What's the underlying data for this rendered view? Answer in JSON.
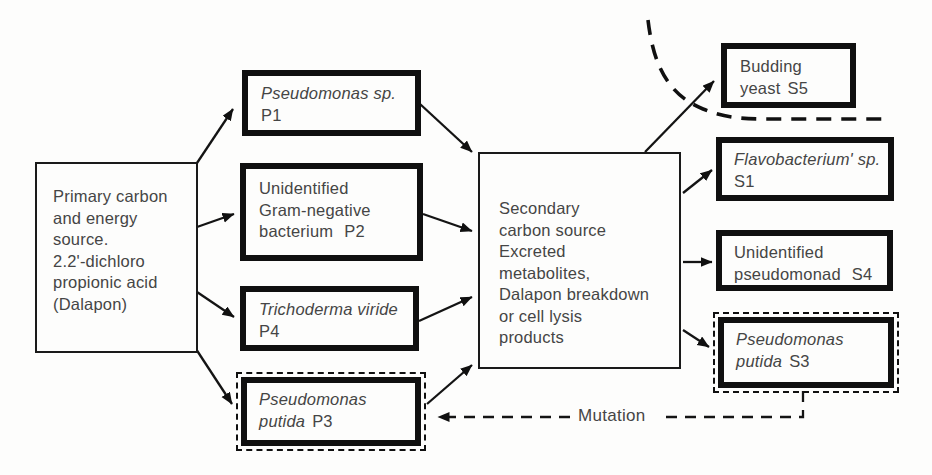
{
  "figure": {
    "kind": "microbial community flow diagram",
    "colors": {
      "background": "#fdfdfc",
      "line": "#101010",
      "text": "#454545"
    }
  },
  "nodes": {
    "primary": {
      "lines": [
        "Primary carbon",
        "and energy",
        "source.",
        "2.2'-dichloro",
        "propionic acid",
        "(Dalapon)"
      ]
    },
    "p1": {
      "species": "Pseudomonas sp.",
      "strain": "P1"
    },
    "p2": {
      "line1": "Unidentified",
      "line2": "Gram-negative",
      "line3": "bacterium",
      "strain": "P2"
    },
    "p4": {
      "species": "Trichoderma viride",
      "strain": "P4"
    },
    "p3": {
      "species_line1": "Pseudomonas",
      "species_line2": "putida",
      "strain": "P3"
    },
    "secondary": {
      "lines": [
        "Secondary",
        "carbon source",
        "Excreted",
        "metabolites,",
        "Dalapon breakdown",
        "or cell lysis",
        "products"
      ]
    },
    "s5": {
      "line1": "Budding",
      "line2": "yeast",
      "strain": "S5"
    },
    "s1": {
      "species": "Flavobacterium' sp.",
      "strain": "S1"
    },
    "s4": {
      "line1": "Unidentified",
      "line2": "pseudomonad",
      "strain": "S4"
    },
    "s3": {
      "species_line1": "Pseudomonas",
      "species_line2": "putida",
      "strain": "S3"
    }
  },
  "labels": {
    "mutation": "Mutation"
  },
  "edges": [
    {
      "from": "primary",
      "to": "p1",
      "style": "solid"
    },
    {
      "from": "primary",
      "to": "p2",
      "style": "solid"
    },
    {
      "from": "primary",
      "to": "p4",
      "style": "solid"
    },
    {
      "from": "primary",
      "to": "p3",
      "style": "solid"
    },
    {
      "from": "p1",
      "to": "secondary",
      "style": "solid"
    },
    {
      "from": "p2",
      "to": "secondary",
      "style": "solid"
    },
    {
      "from": "p4",
      "to": "secondary",
      "style": "solid"
    },
    {
      "from": "p3",
      "to": "secondary",
      "style": "solid"
    },
    {
      "from": "secondary",
      "to": "s5",
      "style": "solid"
    },
    {
      "from": "secondary",
      "to": "s1",
      "style": "solid"
    },
    {
      "from": "secondary",
      "to": "s4",
      "style": "solid"
    },
    {
      "from": "secondary",
      "to": "s3",
      "style": "solid"
    },
    {
      "from": "s3",
      "to": "p3",
      "style": "dashed",
      "label": "Mutation"
    }
  ]
}
